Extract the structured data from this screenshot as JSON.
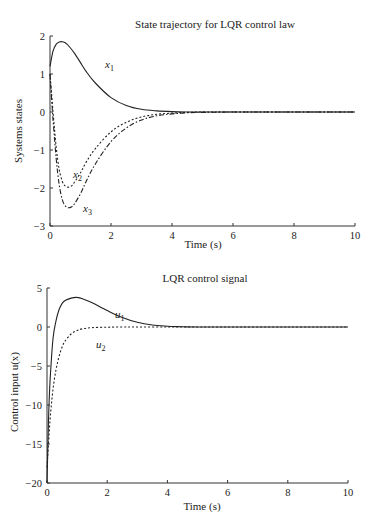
{
  "chart_data": [
    {
      "type": "line",
      "title": "State trajectory for LQR control law",
      "xlabel": "Time (s)",
      "ylabel": "Systems states",
      "xlim": [
        0,
        10
      ],
      "ylim": [
        -3,
        2
      ],
      "xticks": [
        0,
        2,
        4,
        6,
        8,
        10
      ],
      "yticks": [
        -3,
        -2,
        -1,
        0,
        1,
        2
      ],
      "grid": false,
      "legend": "inline curve labels",
      "series": [
        {
          "name": "x1",
          "label_main": "x",
          "label_sub": "1",
          "style": "solid",
          "x": [
            0,
            0.1,
            0.2,
            0.3,
            0.4,
            0.5,
            0.6,
            0.8,
            1.0,
            1.2,
            1.5,
            2.0,
            2.5,
            3.0,
            3.5,
            4.0,
            4.5,
            5.0,
            6.0,
            8.0,
            10.0
          ],
          "y": [
            1.2,
            1.6,
            1.78,
            1.84,
            1.85,
            1.82,
            1.75,
            1.55,
            1.3,
            1.05,
            0.75,
            0.38,
            0.17,
            0.07,
            0.03,
            0.01,
            0.0,
            0.0,
            0.0,
            0.0,
            0.0
          ]
        },
        {
          "name": "x2",
          "label_main": "x",
          "label_sub": "2",
          "style": "dotted",
          "x": [
            0,
            0.1,
            0.2,
            0.3,
            0.4,
            0.5,
            0.6,
            0.7,
            0.8,
            1.0,
            1.2,
            1.5,
            2.0,
            2.5,
            3.0,
            3.5,
            4.0,
            4.5,
            5.0,
            6.0,
            8.0,
            10.0
          ],
          "y": [
            1.0,
            0.0,
            -0.9,
            -1.5,
            -1.82,
            -1.95,
            -1.98,
            -1.95,
            -1.85,
            -1.6,
            -1.3,
            -0.95,
            -0.52,
            -0.27,
            -0.13,
            -0.06,
            -0.03,
            -0.01,
            0.0,
            0.0,
            0.0,
            0.0
          ]
        },
        {
          "name": "x3",
          "label_main": "x",
          "label_sub": "3",
          "style": "dashdot",
          "x": [
            0,
            0.1,
            0.2,
            0.3,
            0.4,
            0.5,
            0.6,
            0.7,
            0.8,
            1.0,
            1.2,
            1.5,
            2.0,
            2.5,
            3.0,
            3.5,
            4.0,
            4.5,
            5.0,
            6.0,
            8.0,
            10.0
          ],
          "y": [
            1.0,
            -0.2,
            -1.2,
            -1.9,
            -2.3,
            -2.47,
            -2.52,
            -2.5,
            -2.42,
            -2.15,
            -1.8,
            -1.35,
            -0.78,
            -0.42,
            -0.21,
            -0.1,
            -0.05,
            -0.02,
            -0.01,
            0.0,
            0.0,
            0.0
          ]
        }
      ]
    },
    {
      "type": "line",
      "title": "LQR control signal",
      "xlabel": "Time (s)",
      "ylabel": "Control input u(x)",
      "xlim": [
        0,
        10
      ],
      "ylim": [
        -20,
        5
      ],
      "xticks": [
        0,
        2,
        4,
        6,
        8,
        10
      ],
      "yticks": [
        -20,
        -15,
        -10,
        -5,
        0,
        5
      ],
      "grid": false,
      "legend": "inline curve labels",
      "series": [
        {
          "name": "u1",
          "label_main": "u",
          "label_sub": "1",
          "style": "solid",
          "x": [
            0,
            0.05,
            0.1,
            0.2,
            0.3,
            0.4,
            0.5,
            0.6,
            0.8,
            1.0,
            1.2,
            1.5,
            2.0,
            2.5,
            3.0,
            3.5,
            4.0,
            4.5,
            5.0,
            6.0,
            8.0,
            10.0
          ],
          "y": [
            -20,
            -12,
            -7,
            -1.5,
            0.8,
            2.2,
            3.0,
            3.4,
            3.7,
            3.8,
            3.6,
            3.1,
            2.1,
            1.2,
            0.6,
            0.25,
            0.1,
            0.03,
            0.0,
            0.0,
            0.0,
            0.0
          ]
        },
        {
          "name": "u2",
          "label_main": "u",
          "label_sub": "2",
          "style": "dotted",
          "x": [
            0,
            0.1,
            0.2,
            0.3,
            0.4,
            0.5,
            0.6,
            0.8,
            1.0,
            1.2,
            1.5,
            2.0,
            2.5,
            3.0,
            4.0,
            5.0,
            6.0,
            8.0,
            10.0
          ],
          "y": [
            -18,
            -12,
            -8,
            -5.5,
            -3.8,
            -2.6,
            -1.8,
            -0.9,
            -0.45,
            -0.22,
            -0.08,
            -0.02,
            0.0,
            0.0,
            0.0,
            0.0,
            0.0,
            0.0,
            0.0
          ]
        }
      ]
    }
  ]
}
